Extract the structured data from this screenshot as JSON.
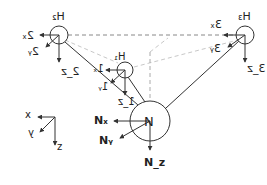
{
  "diagram": {
    "atoms": [
      {
        "id": "H2",
        "label": "H",
        "sub": "2",
        "cx": 59,
        "cy": 35,
        "r": 9
      },
      {
        "id": "H3",
        "label": "H",
        "sub": "3",
        "cx": 245,
        "cy": 35,
        "r": 9
      },
      {
        "id": "H1",
        "label": "H",
        "sub": "1",
        "cx": 125,
        "cy": 70,
        "r": 8
      },
      {
        "id": "N",
        "label": "N",
        "cx": 150,
        "cy": 121,
        "r": 20
      }
    ],
    "vector_labels": {
      "H2": {
        "x": "2x",
        "y": "2y",
        "z": "2z"
      },
      "H3": {
        "x": "3x",
        "y": "3y",
        "z": "3z"
      },
      "H1": {
        "x": "1x",
        "y": "1y",
        "z": "1z"
      },
      "N": {
        "x": "Nx",
        "y": "Ny",
        "z": "Nz"
      }
    },
    "axes": {
      "x": "x",
      "y": "y",
      "z": "z"
    },
    "colors": {
      "line": "#333333",
      "dashed_dark": "#888888",
      "dashed_light": "#c8c8c8"
    }
  }
}
